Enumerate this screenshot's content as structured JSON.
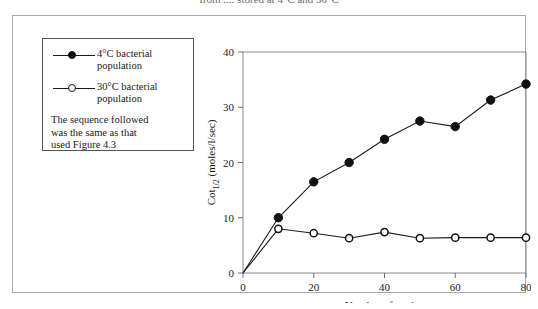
{
  "caption": {
    "fragment_text": "from .... stored at 4°C and 30°C"
  },
  "legend": {
    "entries": [
      {
        "marker": "filled-circle",
        "label_line1": "4°C bacterial",
        "label_line2": "population"
      },
      {
        "marker": "open-circle",
        "label_line1": "30°C bacterial",
        "label_line2": "population"
      }
    ],
    "note_line1": "The sequence followed",
    "note_line2": "was the same as that",
    "note_line3": "used Figure 4.3"
  },
  "chart_data": {
    "type": "line",
    "title": "",
    "xlabel": "Number of strains",
    "ylabel": "Cot1/2 (moles/l/sec)",
    "ylabel_base": "Cot",
    "ylabel_sub": "1/2",
    "ylabel_rest": " (moles/l/sec)",
    "xlim": [
      0,
      80
    ],
    "ylim": [
      0,
      40
    ],
    "xticks": [
      0,
      20,
      40,
      60,
      80
    ],
    "yticks": [
      0,
      10,
      20,
      30,
      40
    ],
    "xtick_labels": [
      "0",
      "20",
      "40",
      "60",
      "80"
    ],
    "ytick_labels": [
      "0",
      "10",
      "20",
      "30",
      "40"
    ],
    "grid": false,
    "legend_position": "outside-left",
    "x": [
      0,
      10,
      20,
      30,
      40,
      50,
      60,
      70,
      80
    ],
    "series": [
      {
        "name": "4°C bacterial population",
        "marker": "filled-circle",
        "color": "#111111",
        "values": [
          0,
          10.0,
          16.5,
          20.0,
          24.2,
          27.5,
          26.5,
          31.3,
          34.2
        ]
      },
      {
        "name": "30°C bacterial population",
        "marker": "open-circle",
        "color": "#111111",
        "values": [
          0,
          8.0,
          7.2,
          6.3,
          7.4,
          6.3,
          6.4,
          6.4,
          6.4
        ]
      }
    ]
  },
  "colors": {
    "ink": "#1a1a1a",
    "axis": "#8a8a8a",
    "frame": "#a9a9a9",
    "legend_border": "#555555",
    "background": "#ffffff"
  }
}
